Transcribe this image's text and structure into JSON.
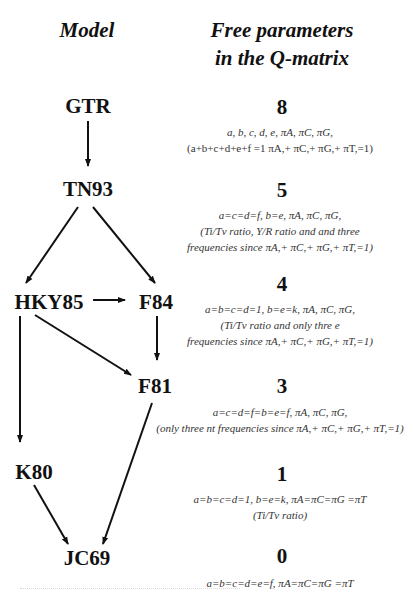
{
  "headers": {
    "model": "Model",
    "params_line1": "Free parameters",
    "params_line2": "in the Q-matrix"
  },
  "colors": {
    "text": "#111111",
    "desc_text": "#333333",
    "edge": "#111111",
    "background": "#ffffff"
  },
  "nodes": {
    "gtr": "GTR",
    "tn93": "TN93",
    "hky85": "HKY85",
    "f84": "F84",
    "f81": "F81",
    "k80": "K80",
    "jc69": "JC69"
  },
  "edges": [
    {
      "from": "GTR",
      "to": "TN93"
    },
    {
      "from": "TN93",
      "to": "HKY85"
    },
    {
      "from": "TN93",
      "to": "F84"
    },
    {
      "from": "HKY85",
      "to": "F84"
    },
    {
      "from": "HKY85",
      "to": "F81"
    },
    {
      "from": "F84",
      "to": "F81"
    },
    {
      "from": "HKY85",
      "to": "K80"
    },
    {
      "from": "K80",
      "to": "JC69"
    },
    {
      "from": "F81",
      "to": "JC69"
    }
  ],
  "rows": {
    "gtr": {
      "count": "8",
      "lines": [
        "a, b, c, d, e, πA, πC, πG,",
        "(a+b+c+d+e+f =1   πA,+ πC,+ πG,+ πT,=1)"
      ]
    },
    "tn93": {
      "count": "5",
      "lines": [
        "a=c=d=f, b=e, πA, πC, πG,",
        "(Ti/Tv ratio, Y/R ratio and and three",
        "frequencies since πA,+ πC,+ πG,+ πT,=1)"
      ]
    },
    "f84": {
      "count": "4",
      "lines": [
        "a=b=c=d=1,   b=e=k, πA, πC, πG,",
        "(Ti/Tv ratio and only thre e",
        "frequencies since πA,+ πC,+ πG,+ πT,=1)"
      ]
    },
    "f81": {
      "count": "3",
      "lines": [
        "a=c=d=f=b=e=f, πA, πC, πG,",
        "(only three nt frequencies since πA,+ πC,+ πG,+ πT,=1)"
      ]
    },
    "k80": {
      "count": "1",
      "lines": [
        "a=b=c=d=1,   b=e=k,   πA=πC=πG =πT",
        "(Ti/Tv ratio)"
      ]
    },
    "jc69": {
      "count": "0",
      "lines": [
        "a=b=c=d=e=f,    πA=πC=πG =πT"
      ]
    }
  }
}
